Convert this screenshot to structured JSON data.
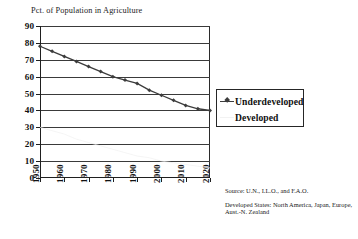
{
  "chart_data": {
    "type": "line",
    "title": "Pct. of Population in Agriculture",
    "xlabel": "",
    "ylabel": "",
    "xlim": [
      1950,
      2020
    ],
    "ylim": [
      0,
      90
    ],
    "grid": true,
    "legend_position": "right",
    "categories": [
      1950,
      1955,
      1960,
      1965,
      1970,
      1975,
      1980,
      1985,
      1990,
      1995,
      2000,
      2005,
      2010,
      2015,
      2020
    ],
    "series": [
      {
        "name": "Underdeveloped",
        "color": "#3c3c3c",
        "marker": "diamond",
        "values": [
          78,
          75,
          72,
          69,
          66,
          63,
          60,
          58,
          56,
          52,
          49,
          46,
          43,
          41,
          40
        ]
      },
      {
        "name": "Developed",
        "color": "#f0f0f0",
        "marker": "none",
        "values": [
          30,
          28,
          26,
          23,
          21,
          19,
          17,
          15,
          13,
          12,
          10,
          9,
          8,
          7,
          6
        ]
      }
    ],
    "x_ticks": [
      "1950",
      "1960",
      "1970",
      "1980",
      "1990",
      "2000",
      "2010",
      "2020"
    ],
    "y_ticks": [
      "0",
      "10",
      "20",
      "30",
      "40",
      "50",
      "60",
      "70",
      "80",
      "90"
    ],
    "notes": {
      "source": "Source: U.N., I.L.O., and F.A.O.",
      "developed_states": "Developed States: North America, Japan, Europe, Aust.-N. Zealand"
    }
  },
  "legend": {
    "entries": [
      {
        "label": "Underdeveloped",
        "key": "line"
      },
      {
        "label": "Developed",
        "key": "faint"
      }
    ]
  }
}
